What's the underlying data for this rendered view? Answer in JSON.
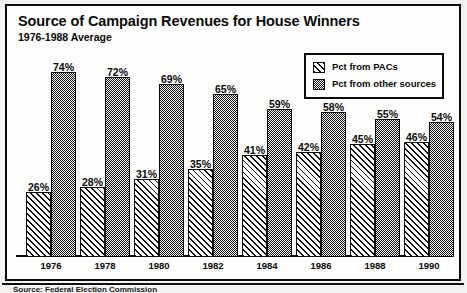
{
  "chart_data": {
    "type": "bar",
    "title": "Source of Campaign Revenues for House Winners",
    "subtitle": "1976-1988 Average",
    "xlabel": "",
    "ylabel": "",
    "ylim": [
      0,
      100
    ],
    "grid": false,
    "legend_position": "top-right",
    "value_suffix": "%",
    "categories": [
      "1976",
      "1978",
      "1980",
      "1982",
      "1984",
      "1986",
      "1988",
      "1990"
    ],
    "series": [
      {
        "name": "Pct from PACs",
        "pattern": "diagonal-hatch",
        "values": [
          26,
          28,
          31,
          35,
          41,
          42,
          45,
          46
        ],
        "labels": [
          "26%",
          "28%",
          "31%",
          "35%",
          "41%",
          "42%",
          "45%",
          "46%"
        ]
      },
      {
        "name": "Pct from other sources",
        "pattern": "stipple",
        "values": [
          74,
          72,
          69,
          65,
          59,
          58,
          55,
          54
        ],
        "labels": [
          "74%",
          "72%",
          "69%",
          "65%",
          "59%",
          "58%",
          "55%",
          "54%"
        ]
      }
    ]
  },
  "legend": {
    "items": [
      {
        "label": "Pct from PACs",
        "pattern": "diagonal-hatch"
      },
      {
        "label": "Pct from other sources",
        "pattern": "stipple"
      }
    ]
  },
  "footer": {
    "source_note": "Source: Federal Election Commission"
  },
  "colors": {
    "ink": "#0b0b0b",
    "page": "#f4f3f1",
    "panel": "#fdfdfc"
  }
}
